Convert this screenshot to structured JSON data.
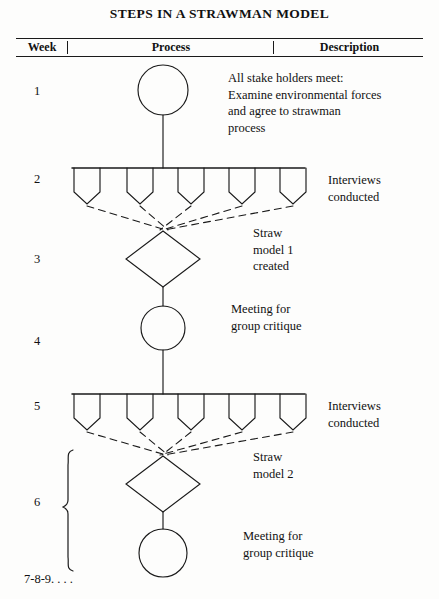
{
  "title": "STEPS IN A STRAWMAN MODEL",
  "table_header": {
    "week": "Week",
    "process": "Process",
    "description": "Description"
  },
  "week_labels": {
    "w1": "1",
    "w2": "2",
    "w3": "3",
    "w4": "4",
    "w5": "5",
    "w6": "6",
    "w789": "7-8-9. . . ."
  },
  "descriptions": {
    "stakeholders": "All stake holders meet:\nExamine environmental forces\nand agree to strawman\nprocess",
    "stakeholders_lines": [
      "All stake holders meet:",
      "Examine environmental forces",
      "and agree to strawman",
      "process"
    ],
    "interviews_1_line1": "Interviews",
    "interviews_1_line2": "conducted",
    "straw1_line1": "Straw",
    "straw1_line2": "model 1",
    "straw1_line3": "created",
    "meeting_1_line1": "Meeting for",
    "meeting_1_line2": "group critique",
    "interviews_2_line1": "Interviews",
    "interviews_2_line2": "conducted",
    "straw2_line1": "Straw",
    "straw2_line2": "model 2",
    "meeting_2_line1": "Meeting for",
    "meeting_2_line2": "group critique"
  },
  "diagram": {
    "type": "flow-diagram",
    "ink_color": "#1a1a1a",
    "paper_color": "#fdfdfc",
    "axis_x_center": 163,
    "nodes": [
      {
        "id": "circle-1",
        "shape": "circle",
        "cx": 163,
        "cy": 90,
        "r": 25,
        "week": "1",
        "label": "All stake holders meet"
      },
      {
        "id": "interview-bar-1",
        "shape": "bar",
        "x1": 72,
        "x2": 305,
        "y": 168,
        "week": "2",
        "label": "Interviews conducted",
        "count": 5
      },
      {
        "id": "diamond-1",
        "shape": "diamond",
        "cx": 163,
        "cy": 258,
        "rx": 37,
        "ry": 28,
        "week": "3",
        "label": "Straw model 1 created"
      },
      {
        "id": "circle-2",
        "shape": "circle",
        "cx": 163,
        "cy": 328,
        "r": 22,
        "week": "4",
        "label": "Meeting for group critique"
      },
      {
        "id": "interview-bar-2",
        "shape": "bar",
        "x1": 72,
        "x2": 305,
        "y": 394,
        "week": "5",
        "label": "Interviews conducted",
        "count": 5
      },
      {
        "id": "diamond-2",
        "shape": "diamond",
        "cx": 163,
        "cy": 483,
        "rx": 37,
        "ry": 28,
        "week": "6",
        "label": "Straw model 2"
      },
      {
        "id": "circle-3",
        "shape": "circle",
        "cx": 163,
        "cy": 553,
        "r": 24,
        "week": "6",
        "label": "Meeting for group critique"
      }
    ],
    "brace": {
      "x": 68,
      "y_top": 450,
      "y_bottom": 572,
      "label": "6"
    },
    "dashed_converge_1": {
      "apex_x": 163,
      "apex_y": 228
    },
    "dashed_converge_2": {
      "apex_x": 163,
      "apex_y": 453
    }
  }
}
